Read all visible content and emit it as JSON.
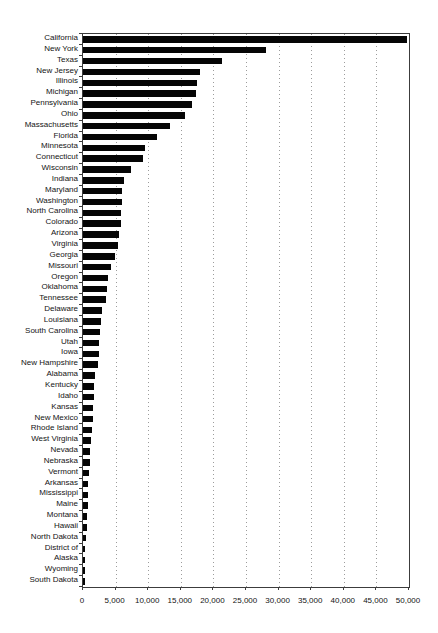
{
  "page": {
    "background": "#ffffff"
  },
  "chart_data": {
    "type": "bar",
    "orientation": "horizontal",
    "title": "",
    "subtitle": "",
    "xlabel": "",
    "ylabel": "",
    "xlim": [
      0,
      50000
    ],
    "grid": "vertical-dotted",
    "legend": "none",
    "colors": {
      "bar": "#050505",
      "gridline": "#9c9c9c",
      "axis": "#3c3c3c",
      "background": "#ffffff",
      "text": "#141414"
    },
    "xticks": [
      {
        "value": 0,
        "label": "0"
      },
      {
        "value": 5000,
        "label": "5,000"
      },
      {
        "value": 10000,
        "label": "10,000"
      },
      {
        "value": 15000,
        "label": "15,000"
      },
      {
        "value": 20000,
        "label": "20,000"
      },
      {
        "value": 25000,
        "label": "25,000"
      },
      {
        "value": 30000,
        "label": "30,000"
      },
      {
        "value": 35000,
        "label": "35,000"
      },
      {
        "value": 40000,
        "label": "40,000"
      },
      {
        "value": 45000,
        "label": "45,000"
      },
      {
        "value": 50000,
        "label": "50,000"
      }
    ],
    "categories": [
      "California",
      "New York",
      "Texas",
      "New Jersey",
      "Illinois",
      "Michigan",
      "Pennsylvania",
      "Ohio",
      "Massachusetts",
      "Florida",
      "Minnesota",
      "Connecticut",
      "Wisconsin",
      "Indiana",
      "Maryland",
      "Washington",
      "North Carolina",
      "Colorado",
      "Arizona",
      "Virginia",
      "Georgia",
      "Missouri",
      "Oregon",
      "Oklahoma",
      "Tennessee",
      "Delaware",
      "Louisiana",
      "South Carolina",
      "Utah",
      "Iowa",
      "New Hampshire",
      "Alabama",
      "Kentucky",
      "Idaho",
      "Kansas",
      "New Mexico",
      "Rhode Island",
      "West Virginia",
      "Nevada",
      "Nebraska",
      "Vermont",
      "Arkansas",
      "Mississippi",
      "Maine",
      "Montana",
      "Hawaii",
      "North Dakota",
      "District of",
      "Alaska",
      "Wyoming",
      "South Dakota"
    ],
    "values": [
      49700,
      28000,
      21300,
      18000,
      17500,
      17300,
      16700,
      15600,
      13400,
      11400,
      9500,
      9200,
      7300,
      6300,
      6000,
      5950,
      5800,
      5750,
      5500,
      5350,
      4900,
      4300,
      3800,
      3700,
      3550,
      2950,
      2800,
      2650,
      2500,
      2450,
      2250,
      1800,
      1750,
      1700,
      1600,
      1450,
      1350,
      1200,
      1100,
      1050,
      870,
      820,
      760,
      700,
      570,
      540,
      420,
      360,
      320,
      300,
      260
    ]
  }
}
